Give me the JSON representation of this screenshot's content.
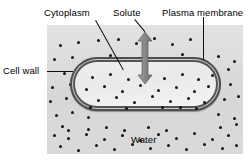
{
  "diagram": {
    "labels": {
      "cytoplasm": "Cytoplasm",
      "solute": "Solute",
      "plasma_membrane": "Plasma membrane",
      "cell_wall": "Cell wall",
      "water": "Water"
    },
    "colors": {
      "background": "#ffffff",
      "extracellular_fluid": "#dcdcdc",
      "cell_wall": "#4e4e4e",
      "plasma_membrane": "#555555",
      "cytoplasm": "#efefef",
      "solute_particle": "#131313",
      "arrow": "#8a8a8a",
      "text": "#000000",
      "leader_line": "#111111"
    },
    "arrow": {
      "name": "water-movement-arrow",
      "direction": "bidirectional-vertical",
      "description": "Double-headed arrow crossing the plasma membrane indicating water moving in and out"
    },
    "solute_particles": {
      "outside_count": 74,
      "inside_count": 28,
      "outside": [
        [
          12,
          19
        ],
        [
          30,
          16
        ],
        [
          50,
          14
        ],
        [
          70,
          13
        ],
        [
          88,
          17
        ],
        [
          106,
          12
        ],
        [
          124,
          18
        ],
        [
          142,
          13
        ],
        [
          6,
          33
        ],
        [
          24,
          31
        ],
        [
          44,
          35
        ],
        [
          62,
          29
        ],
        [
          80,
          34
        ],
        [
          98,
          30
        ],
        [
          116,
          36
        ],
        [
          134,
          28
        ],
        [
          152,
          33
        ],
        [
          170,
          30
        ],
        [
          186,
          35
        ],
        [
          16,
          47
        ],
        [
          34,
          44
        ],
        [
          54,
          49
        ],
        [
          74,
          43
        ],
        [
          92,
          48
        ],
        [
          110,
          45
        ],
        [
          128,
          50
        ],
        [
          146,
          44
        ],
        [
          164,
          49
        ],
        [
          180,
          43
        ],
        [
          4,
          61
        ],
        [
          22,
          58
        ],
        [
          40,
          63
        ],
        [
          58,
          57
        ],
        [
          168,
          62
        ],
        [
          182,
          58
        ],
        [
          2,
          75
        ],
        [
          18,
          72
        ],
        [
          34,
          77
        ],
        [
          176,
          73
        ],
        [
          190,
          70
        ],
        [
          8,
          89
        ],
        [
          24,
          86
        ],
        [
          40,
          91
        ],
        [
          170,
          88
        ],
        [
          186,
          92
        ],
        [
          14,
          100
        ],
        [
          172,
          101
        ],
        [
          188,
          98
        ],
        [
          6,
          109
        ],
        [
          20,
          112
        ],
        [
          38,
          108
        ],
        [
          56,
          113
        ],
        [
          74,
          109
        ],
        [
          92,
          114
        ],
        [
          110,
          108
        ],
        [
          128,
          112
        ],
        [
          146,
          107
        ],
        [
          164,
          113
        ],
        [
          180,
          109
        ],
        [
          12,
          120
        ],
        [
          30,
          124
        ],
        [
          48,
          119
        ],
        [
          66,
          123
        ],
        [
          84,
          118
        ],
        [
          102,
          122
        ],
        [
          120,
          119
        ],
        [
          138,
          123
        ],
        [
          156,
          118
        ],
        [
          174,
          122
        ],
        [
          188,
          119
        ],
        [
          20,
          104
        ],
        [
          40,
          103
        ],
        [
          58,
          101
        ],
        [
          76,
          104
        ],
        [
          100,
          101
        ],
        [
          118,
          104
        ]
      ],
      "inside": [
        [
          16,
          14
        ],
        [
          34,
          11
        ],
        [
          52,
          16
        ],
        [
          70,
          12
        ],
        [
          88,
          15
        ],
        [
          106,
          11
        ],
        [
          122,
          16
        ],
        [
          136,
          12
        ],
        [
          10,
          26
        ],
        [
          28,
          23
        ],
        [
          46,
          28
        ],
        [
          64,
          22
        ],
        [
          82,
          27
        ],
        [
          100,
          24
        ],
        [
          118,
          28
        ],
        [
          132,
          23
        ],
        [
          22,
          37
        ],
        [
          40,
          34
        ],
        [
          58,
          39
        ],
        [
          76,
          33
        ],
        [
          94,
          38
        ],
        [
          112,
          35
        ],
        [
          128,
          39
        ],
        [
          14,
          44
        ],
        [
          50,
          45
        ],
        [
          86,
          44
        ],
        [
          120,
          45
        ],
        [
          104,
          44
        ]
      ]
    },
    "leaders": [
      {
        "name": "cytoplasm-leader",
        "type": "diagonal"
      },
      {
        "name": "solute-leader",
        "type": "diagonal"
      },
      {
        "name": "plasma-membrane-leader",
        "type": "vertical"
      },
      {
        "name": "cell-wall-leader",
        "type": "horizontal"
      }
    ]
  }
}
